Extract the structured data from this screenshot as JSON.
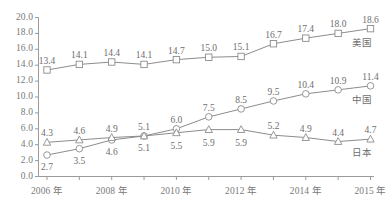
{
  "chart_data": {
    "type": "line",
    "title": "",
    "subtitle": "",
    "xlabel": "",
    "ylabel": "",
    "grid": false,
    "legend_position": "right-inline",
    "ylim": [
      0.0,
      20.0
    ],
    "ytick_step": 2.0,
    "ytick_labels": [
      "0.0",
      "2.0",
      "4.0",
      "6.0",
      "8.0",
      "10.0",
      "12.0",
      "14.0",
      "16.0",
      "18.0",
      "20.0"
    ],
    "x": [
      2006,
      2007,
      2008,
      2009,
      2010,
      2011,
      2012,
      2013,
      2014,
      2015,
      2016
    ],
    "xtick_labels": [
      {
        "index": 0,
        "label": "2006 年"
      },
      {
        "index": 2,
        "label": "2008 年"
      },
      {
        "index": 4,
        "label": "2010 年"
      },
      {
        "index": 6,
        "label": "2012 年"
      },
      {
        "index": 8,
        "label": "2014 年"
      },
      {
        "index": 10,
        "label": "2015 年"
      }
    ],
    "series": [
      {
        "name": "美国",
        "marker": "square",
        "label_position": "above",
        "values": [
          13.4,
          14.1,
          14.4,
          14.1,
          14.7,
          15.0,
          15.1,
          16.7,
          17.4,
          18.0,
          18.6
        ],
        "value_labels": [
          "13.4",
          "14.1",
          "14.4",
          "14.1",
          "14.7",
          "15.0",
          "15.1",
          "16.7",
          "17.4",
          "18.0",
          "18.6"
        ]
      },
      {
        "name": "中国",
        "marker": "circle",
        "label_position": "mixed",
        "values": [
          2.7,
          3.5,
          4.6,
          5.1,
          6.0,
          7.5,
          8.5,
          9.5,
          10.4,
          10.9,
          11.4
        ],
        "value_labels": [
          "2.7",
          "3.5",
          "4.6",
          "5.1",
          "6.0",
          "7.5",
          "8.5",
          "9.5",
          "10.4",
          "10.9",
          "11.4"
        ]
      },
      {
        "name": "日本",
        "marker": "triangle",
        "label_position": "mixed",
        "values": [
          4.3,
          4.6,
          4.9,
          5.1,
          5.5,
          5.9,
          5.9,
          5.2,
          4.9,
          4.4,
          4.7
        ],
        "value_labels": [
          "4.3",
          "4.6",
          "4.9",
          "5.1",
          "5.5",
          "5.9",
          "5.9",
          "5.2",
          "4.9",
          "4.4",
          "4.7"
        ]
      }
    ],
    "colors": {
      "line": "#8c8c8c",
      "marker_fill": "#ffffff",
      "marker_stroke": "#8c8c8c",
      "axis": "#9a9a9a",
      "text": "#6e6e6e",
      "background": "#ffffff"
    }
  }
}
